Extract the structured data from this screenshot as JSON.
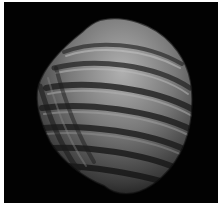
{
  "image": {
    "subject": "fossil bivalve shell",
    "background_color": "#020202",
    "frame_color": "#ffffff",
    "shell_colors": {
      "light": "#a8a8a8",
      "mid": "#6e6e6e",
      "dark": "#2a2a2a"
    }
  }
}
